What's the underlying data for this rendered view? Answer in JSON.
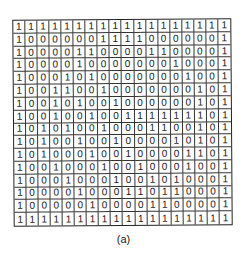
{
  "figure": {
    "caption": "(a)",
    "rows": 16,
    "cols": 18,
    "grid": [
      [
        1,
        1,
        1,
        1,
        1,
        1,
        1,
        1,
        1,
        1,
        1,
        1,
        1,
        1,
        1,
        1,
        1,
        1
      ],
      [
        1,
        0,
        0,
        0,
        0,
        0,
        0,
        1,
        1,
        1,
        1,
        0,
        0,
        0,
        0,
        0,
        0,
        1
      ],
      [
        1,
        0,
        0,
        0,
        0,
        1,
        1,
        0,
        0,
        0,
        0,
        1,
        1,
        0,
        0,
        0,
        0,
        1
      ],
      [
        1,
        0,
        0,
        0,
        0,
        1,
        0,
        0,
        0,
        0,
        0,
        0,
        0,
        1,
        0,
        0,
        0,
        1
      ],
      [
        1,
        0,
        0,
        0,
        1,
        0,
        1,
        0,
        0,
        0,
        0,
        0,
        0,
        0,
        1,
        0,
        0,
        1
      ],
      [
        1,
        0,
        0,
        1,
        1,
        0,
        0,
        1,
        0,
        0,
        0,
        0,
        0,
        0,
        0,
        1,
        0,
        1
      ],
      [
        1,
        0,
        0,
        1,
        0,
        1,
        0,
        0,
        1,
        0,
        0,
        0,
        0,
        0,
        0,
        1,
        0,
        1
      ],
      [
        1,
        0,
        0,
        1,
        0,
        0,
        1,
        0,
        0,
        1,
        1,
        1,
        1,
        1,
        1,
        1,
        0,
        1
      ],
      [
        1,
        0,
        1,
        0,
        1,
        0,
        0,
        1,
        0,
        0,
        0,
        1,
        1,
        0,
        0,
        1,
        0,
        1
      ],
      [
        1,
        0,
        1,
        0,
        0,
        1,
        0,
        0,
        1,
        0,
        0,
        0,
        0,
        1,
        0,
        1,
        0,
        1
      ],
      [
        1,
        0,
        1,
        0,
        0,
        0,
        1,
        0,
        0,
        1,
        0,
        0,
        0,
        0,
        1,
        1,
        0,
        1
      ],
      [
        1,
        0,
        0,
        1,
        0,
        0,
        0,
        1,
        0,
        0,
        1,
        0,
        0,
        0,
        1,
        0,
        0,
        1
      ],
      [
        1,
        0,
        0,
        0,
        1,
        0,
        0,
        0,
        1,
        0,
        0,
        1,
        0,
        1,
        0,
        0,
        0,
        1
      ],
      [
        1,
        0,
        0,
        0,
        0,
        1,
        0,
        0,
        0,
        1,
        1,
        0,
        1,
        1,
        0,
        0,
        0,
        1
      ],
      [
        1,
        0,
        0,
        0,
        0,
        0,
        1,
        0,
        0,
        0,
        0,
        1,
        1,
        0,
        0,
        0,
        0,
        1
      ],
      [
        1,
        1,
        1,
        1,
        1,
        1,
        1,
        1,
        1,
        1,
        1,
        1,
        1,
        1,
        1,
        1,
        1,
        1
      ]
    ]
  }
}
